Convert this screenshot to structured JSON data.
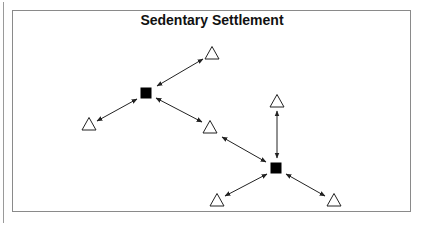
{
  "title": "Sedentary Settlement",
  "colors": {
    "stroke": "#222222",
    "frame": "#8a8a8a",
    "fill_settlement": "#000000"
  },
  "legend_semantics": {
    "square": "settlement",
    "triangle": "resource/site"
  },
  "nodes": [
    {
      "id": "settlement-1",
      "type": "square",
      "x": 146,
      "y": 93
    },
    {
      "id": "settlement-2",
      "type": "square",
      "x": 276,
      "y": 168
    },
    {
      "id": "site-top",
      "type": "triangle",
      "x": 212,
      "y": 53
    },
    {
      "id": "site-left",
      "type": "triangle",
      "x": 89,
      "y": 124
    },
    {
      "id": "site-middle",
      "type": "triangle",
      "x": 210,
      "y": 127
    },
    {
      "id": "site-upper-right",
      "type": "triangle",
      "x": 277,
      "y": 101
    },
    {
      "id": "site-bottom-left",
      "type": "triangle",
      "x": 217,
      "y": 200
    },
    {
      "id": "site-bottom-right",
      "type": "triangle",
      "x": 334,
      "y": 200
    }
  ],
  "edges": [
    {
      "from": "settlement-1",
      "to": "site-top",
      "x1": 157,
      "y1": 86,
      "x2": 203,
      "y2": 59,
      "bidirectional": true
    },
    {
      "from": "settlement-1",
      "to": "site-left",
      "x1": 137,
      "y1": 99,
      "x2": 97,
      "y2": 121,
      "bidirectional": true
    },
    {
      "from": "settlement-1",
      "to": "site-middle",
      "x1": 156,
      "y1": 98,
      "x2": 202,
      "y2": 122,
      "bidirectional": true
    },
    {
      "from": "site-middle",
      "to": "settlement-2",
      "x1": 222,
      "y1": 137,
      "x2": 266,
      "y2": 162,
      "bidirectional": true
    },
    {
      "from": "site-upper-right",
      "to": "settlement-2",
      "x1": 277,
      "y1": 111,
      "x2": 277,
      "y2": 158,
      "bidirectional": true
    },
    {
      "from": "settlement-2",
      "to": "site-bottom-left",
      "x1": 267,
      "y1": 174,
      "x2": 225,
      "y2": 196,
      "bidirectional": true
    },
    {
      "from": "settlement-2",
      "to": "site-bottom-right",
      "x1": 286,
      "y1": 174,
      "x2": 325,
      "y2": 196,
      "bidirectional": true
    }
  ]
}
